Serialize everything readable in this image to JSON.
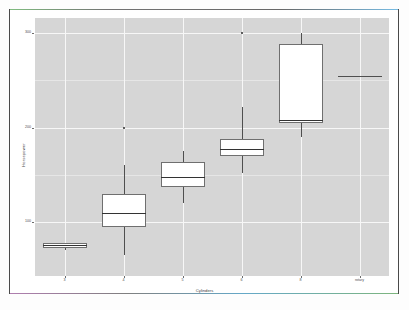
{
  "chart_data": {
    "type": "box",
    "title": "",
    "xlabel": "Cylinders",
    "ylabel": "Horsepower",
    "categories": [
      "3",
      "4",
      "5",
      "6",
      "8",
      "rotary"
    ],
    "ytick_labels": [
      "100",
      "200",
      "300"
    ],
    "ytick_values": [
      100,
      200,
      300
    ],
    "ylim": [
      55,
      315
    ],
    "grid": true,
    "legend": "none",
    "panel_background": "#d6d6d6",
    "gridline_color": "#f7f7f7",
    "box_fill": "#ffffff",
    "box_border": "#6f6f6f",
    "median_color": "#333333",
    "whisker_color": "#4f4f4f",
    "outlier_color": "#2b2b2b",
    "boxes": [
      {
        "category": "3",
        "lower_whisker": 70,
        "q1": 72,
        "median": 76,
        "q3": 78,
        "upper_whisker": 78,
        "outliers": []
      },
      {
        "category": "4",
        "lower_whisker": 65,
        "q1": 95,
        "median": 110,
        "q3": 130,
        "upper_whisker": 160,
        "outliers": [
          200
        ]
      },
      {
        "category": "5",
        "lower_whisker": 120,
        "q1": 137,
        "median": 148,
        "q3": 163,
        "upper_whisker": 175,
        "outliers": []
      },
      {
        "category": "6",
        "lower_whisker": 152,
        "q1": 170,
        "median": 177,
        "q3": 188,
        "upper_whisker": 222,
        "outliers": [
          300
        ]
      },
      {
        "category": "8",
        "lower_whisker": 190,
        "q1": 205,
        "median": 208,
        "q3": 288,
        "upper_whisker": 300,
        "outliers": []
      },
      {
        "category": "rotary",
        "lower_whisker": 255,
        "q1": 255,
        "median": 255,
        "q3": 255,
        "upper_whisker": 255,
        "outliers": []
      }
    ]
  }
}
